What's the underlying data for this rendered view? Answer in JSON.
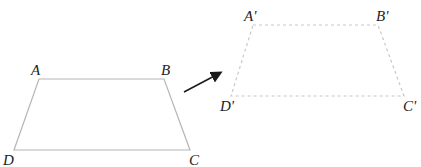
{
  "original": {
    "label": "ABCD",
    "vertices": {
      "A": {
        "label": "A",
        "x": 39,
        "y": 79
      },
      "B": {
        "label": "B",
        "x": 164,
        "y": 79
      },
      "C": {
        "label": "C",
        "x": 190,
        "y": 150
      },
      "D": {
        "label": "D",
        "x": 14,
        "y": 150
      }
    },
    "stroke": "#b5b5b5",
    "style": "solid"
  },
  "image": {
    "label": "A'B'C'D'",
    "vertices": {
      "A": {
        "label": "A'",
        "x": 253,
        "y": 25
      },
      "B": {
        "label": "B'",
        "x": 378,
        "y": 25
      },
      "C": {
        "label": "C'",
        "x": 404,
        "y": 96
      },
      "D": {
        "label": "D'",
        "x": 231,
        "y": 96
      }
    },
    "stroke": "#c8c8c8",
    "style": "dashed"
  },
  "arrow": {
    "from": [
      184,
      92
    ],
    "to": [
      222,
      72
    ],
    "color": "#1a1a1a"
  }
}
